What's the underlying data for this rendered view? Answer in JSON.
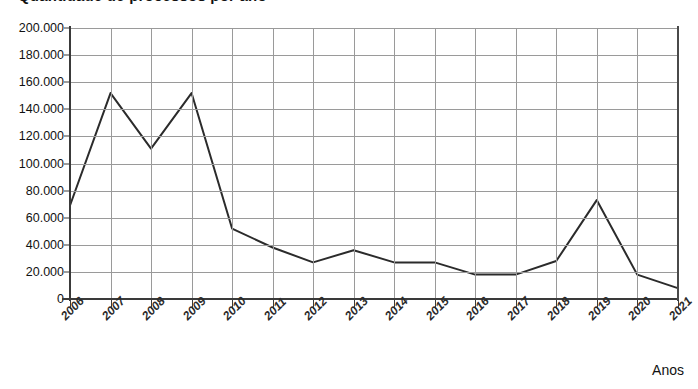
{
  "chart_title": "Quantidade de processos por ano",
  "axis": {
    "x_title": "Anos",
    "y_title": ""
  },
  "chart_data": {
    "type": "line",
    "title": "Quantidade de processos por ano",
    "xlabel": "Anos",
    "ylabel": "",
    "categories": [
      "2006",
      "2007",
      "2008",
      "2009",
      "2010",
      "2011",
      "2012",
      "2013",
      "2014",
      "2015",
      "2016",
      "2017",
      "2018",
      "2019",
      "2020",
      "2021"
    ],
    "values": [
      69000,
      152000,
      111000,
      152000,
      52000,
      38000,
      27000,
      36000,
      27000,
      27000,
      18000,
      18000,
      28000,
      73000,
      18000,
      8000
    ],
    "ylim": [
      0,
      200000
    ],
    "ytick_values": [
      0,
      20000,
      40000,
      60000,
      80000,
      100000,
      120000,
      140000,
      160000,
      180000,
      200000
    ],
    "ytick_labels": [
      "0",
      "20.000",
      "40.000",
      "60.000",
      "80.000",
      "100.000",
      "120.000",
      "140.000",
      "160.000",
      "180.000",
      "200.000"
    ],
    "grid": true,
    "legend": false,
    "legend_position": "none",
    "line_color": "#2b2b2b",
    "grid_color": "#9a9a9a",
    "axis_color": "#3a3a3a"
  }
}
